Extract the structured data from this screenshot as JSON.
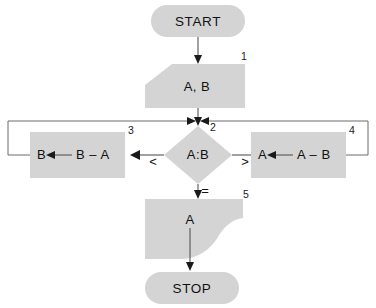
{
  "diagram": {
    "type": "flowchart",
    "colors": {
      "shape_fill": "#d4d4d4",
      "line": "#555555",
      "text": "#111111",
      "background": "#ffffff"
    }
  },
  "nodes": {
    "start": {
      "label": "START",
      "shape": "terminator"
    },
    "input": {
      "label": "A, B",
      "shape": "input-parallelogram",
      "step_number": "1"
    },
    "decision": {
      "label": "A:B",
      "shape": "diamond",
      "step_number": "2",
      "branch_less": "<",
      "branch_greater": ">",
      "branch_equal": "="
    },
    "process_left": {
      "label_target": "B",
      "label_arrow": "←",
      "label_expression": "B – A",
      "shape": "process-rectangle",
      "step_number": "3"
    },
    "process_right": {
      "label_target": "A",
      "label_arrow": "←",
      "label_expression": "A – B",
      "shape": "process-rectangle",
      "step_number": "4"
    },
    "output": {
      "label": "A",
      "shape": "output-document",
      "step_number": "5"
    },
    "stop": {
      "label": "STOP",
      "shape": "terminator"
    }
  },
  "edges": [
    {
      "name": "start-to-input",
      "from": "start",
      "to": "input",
      "label": ""
    },
    {
      "name": "input-to-decision",
      "from": "input",
      "to": "decision",
      "label": ""
    },
    {
      "name": "decision-to-left",
      "from": "decision",
      "to": "process_left",
      "label": "<"
    },
    {
      "name": "decision-to-right",
      "from": "decision",
      "to": "process_right",
      "label": ">"
    },
    {
      "name": "decision-to-output",
      "from": "decision",
      "to": "output",
      "label": "="
    },
    {
      "name": "left-loop-back",
      "from": "process_left",
      "to": "decision",
      "label": ""
    },
    {
      "name": "right-loop-back",
      "from": "process_right",
      "to": "decision",
      "label": ""
    },
    {
      "name": "output-to-stop",
      "from": "output",
      "to": "stop",
      "label": ""
    }
  ]
}
